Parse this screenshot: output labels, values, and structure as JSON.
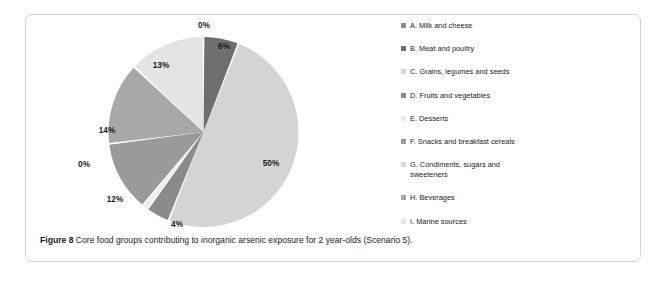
{
  "figure": {
    "caption_label": "Figure 8",
    "caption_text": " Core food groups contributing to inorganic arsenic exposure for 2 year-olds (Scenario 5)."
  },
  "legend": {
    "items": [
      {
        "key": "A",
        "label": "A. Milk and cheese",
        "color": "#8c8c8c"
      },
      {
        "key": "B",
        "label": "B. Meat and poultry",
        "color": "#6e6e6e"
      },
      {
        "key": "C",
        "label": "C. Grains, legumes and seeds",
        "color": "#d4d4d4"
      },
      {
        "key": "D",
        "label": "D. Fruits and vegetables",
        "color": "#8a8a8a"
      },
      {
        "key": "E",
        "label": "E. Desserts",
        "color": "#ececec"
      },
      {
        "key": "F",
        "label": "F. Snacks and breakfast cereals",
        "color": "#9a9a9a"
      },
      {
        "key": "G",
        "label": "G. Condiments, sugars and\nsweeteners",
        "color": "#d9d9d9"
      },
      {
        "key": "H",
        "label": "H. Beverages",
        "color": "#a8a8a8"
      },
      {
        "key": "I",
        "label": "I. Marine sources",
        "color": "#e4e4e4"
      }
    ]
  },
  "chart_data": {
    "type": "pie",
    "title": "Core food groups contributing to inorganic arsenic exposure for 2 year-olds (Scenario 5)",
    "legend_position": "right",
    "start_angle_deg": 0,
    "direction": "clockwise",
    "categories": [
      "A. Milk and cheese",
      "B. Meat and poultry",
      "C. Grains, legumes and seeds",
      "D. Fruits and vegetables",
      "E. Desserts",
      "F. Snacks and breakfast cereals",
      "G. Condiments, sugars and sweeteners",
      "H. Beverages",
      "I. Marine sources"
    ],
    "values": [
      0,
      6,
      50,
      4,
      1,
      12,
      0,
      14,
      13
    ],
    "value_labels": [
      "0%",
      "6%",
      "50%",
      "4%",
      "1%",
      "12%",
      "0%",
      "14%",
      "13%"
    ],
    "colors": [
      "#8c8c8c",
      "#6e6e6e",
      "#d4d4d4",
      "#8a8a8a",
      "#ececec",
      "#9a9a9a",
      "#d9d9d9",
      "#a8a8a8",
      "#e4e4e4"
    ],
    "units": "percent",
    "slice_labels": [
      {
        "text": "0%",
        "x": 178,
        "y": 13,
        "anchor": "middle",
        "inside": false
      },
      {
        "text": "6%",
        "x": 198,
        "y": 34,
        "anchor": "middle",
        "inside": true
      },
      {
        "text": "50%",
        "x": 245,
        "y": 151,
        "anchor": "middle",
        "inside": true
      },
      {
        "text": "4%",
        "x": 151,
        "y": 212,
        "anchor": "middle",
        "inside": true
      },
      {
        "text": "1%",
        "x": 120,
        "y": 219,
        "anchor": "middle",
        "inside": false
      },
      {
        "text": "12%",
        "x": 89,
        "y": 187,
        "anchor": "middle",
        "inside": true
      },
      {
        "text": "0%",
        "x": 58,
        "y": 152,
        "anchor": "middle",
        "inside": false
      },
      {
        "text": "14%",
        "x": 81,
        "y": 118,
        "anchor": "middle",
        "inside": true
      },
      {
        "text": "13%",
        "x": 135,
        "y": 53,
        "anchor": "middle",
        "inside": true
      }
    ]
  }
}
